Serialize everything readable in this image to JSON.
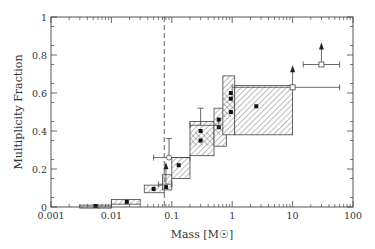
{
  "chart_data": {
    "type": "scatter",
    "title": "",
    "xlabel": "Mass [M☉]",
    "ylabel": "Multiplicity Fraction",
    "xscale": "log",
    "xlim": [
      0.001,
      100
    ],
    "ylim": [
      0,
      1
    ],
    "x_ticks": [
      "0.001",
      "0.01",
      "0.1",
      "1",
      "10",
      "100"
    ],
    "y_ticks": [
      "0",
      "0.2",
      "0.4",
      "0.6",
      "0.8",
      "1"
    ],
    "grid": false,
    "legend": null,
    "reference_line": {
      "orientation": "vertical",
      "style": "dashed",
      "x": 0.075
    },
    "boxes": [
      {
        "x0": 0.003,
        "x1": 0.01,
        "y0": 0.0,
        "y1": 0.01,
        "point": [
          0.0055,
          0.005
        ],
        "hatch": "diag"
      },
      {
        "x0": 0.01,
        "x1": 0.03,
        "y0": 0.015,
        "y1": 0.04,
        "point": [
          0.018,
          0.027
        ],
        "hatch": "diag"
      },
      {
        "x0": 0.035,
        "x1": 0.075,
        "y0": 0.075,
        "y1": 0.115,
        "point": [
          0.05,
          0.095
        ],
        "hatch": "diag"
      },
      {
        "x0": 0.07,
        "x1": 0.1,
        "y0": 0.09,
        "y1": 0.17,
        "point": [
          0.08,
          0.105
        ],
        "hatch": "diag"
      },
      {
        "x0": 0.1,
        "x1": 0.2,
        "y0": 0.15,
        "y1": 0.26,
        "point": [
          0.13,
          0.22
        ],
        "hatch": "diag"
      },
      {
        "x0": 0.2,
        "x1": 0.5,
        "y0": 0.27,
        "y1": 0.45,
        "point": [
          0.3,
          0.35
        ],
        "hatch": "diag+cross"
      },
      {
        "x0": 0.5,
        "x1": 0.8,
        "y0": 0.32,
        "y1": 0.52,
        "point": [
          0.6,
          0.42
        ],
        "hatch": "diag+cross"
      },
      {
        "x0": 0.7,
        "x1": 1.1,
        "y0": 0.38,
        "y1": 0.69,
        "point": [
          0.95,
          0.57
        ],
        "hatch": "diag+cross"
      },
      {
        "x0": 1.1,
        "x1": 10,
        "y0": 0.38,
        "y1": 0.64,
        "point": [
          2.5,
          0.53
        ],
        "hatch": "diag"
      }
    ],
    "points": [
      {
        "x": 0.3,
        "y": 0.4,
        "marker": "filled-square"
      },
      {
        "x": 0.6,
        "y": 0.46,
        "marker": "filled-square"
      },
      {
        "x": 0.95,
        "y": 0.5,
        "marker": "filled-square"
      },
      {
        "x": 0.95,
        "y": 0.6,
        "marker": "filled-square"
      }
    ],
    "errorbar_points": [
      {
        "x": 0.09,
        "y": 0.26,
        "xerr": [
          0.05,
          0.2
        ],
        "yerr": [
          0.0,
          0.36
        ],
        "marker": "open-circle"
      },
      {
        "x": 0.3,
        "y": 0.43,
        "xerr": [
          0.2,
          0.6
        ],
        "yerr": [
          0.0,
          0.52
        ],
        "marker": "none"
      },
      {
        "x": 10,
        "y": 0.63,
        "xerr": [
          1.0,
          60
        ],
        "yerr": null,
        "marker": "open-square",
        "lower_limit": true
      },
      {
        "x": 30,
        "y": 0.75,
        "xerr": [
          15,
          60
        ],
        "yerr": null,
        "marker": "open-square",
        "lower_limit": true
      },
      {
        "x": 0.08,
        "y": 0.12,
        "xerr": [
          0.06,
          0.1
        ],
        "yerr": null,
        "marker": "none",
        "lower_limit": true
      }
    ]
  }
}
